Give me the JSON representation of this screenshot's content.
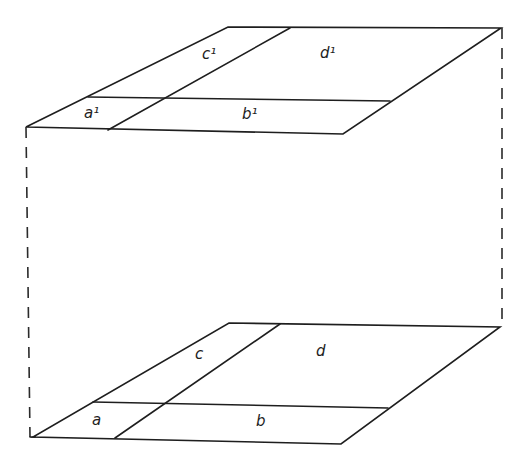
{
  "diagram": {
    "type": "two parallel subdivided planes connected by dashed verticals",
    "colors": {
      "line": "#1e1e1e",
      "background": "#ffffff"
    },
    "top_plane": {
      "labels": {
        "a": "a¹",
        "b": "b¹",
        "c": "c¹",
        "d": "d¹"
      }
    },
    "bottom_plane": {
      "labels": {
        "a": "a",
        "b": "b",
        "c": "c",
        "d": "d"
      }
    }
  }
}
